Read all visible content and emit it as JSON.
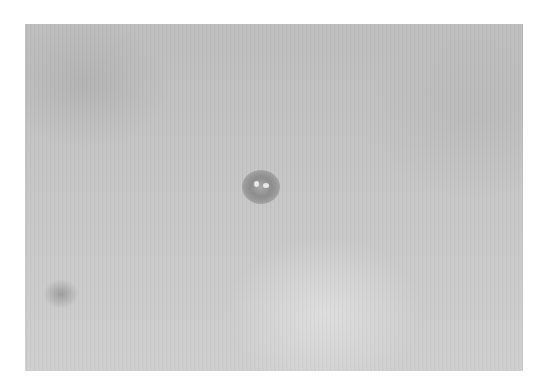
{
  "image": {
    "type": "photograph",
    "color_mode": "grayscale",
    "subject": "close-up of skin surface with a small raised lesion",
    "features": [
      {
        "name": "central-lesion",
        "description": "small round dark lesion with lighter center points"
      },
      {
        "name": "faint-spot",
        "description": "faint darker spot near lower-left"
      }
    ],
    "colors": {
      "background": "#ffffff",
      "surface": "#c4c4c4",
      "lesion": "#8d8d8d"
    }
  }
}
